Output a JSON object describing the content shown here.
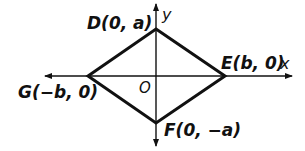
{
  "diagram": {
    "type": "rhombus-on-coordinate-plane",
    "colors": {
      "stroke": "#111111",
      "background": "#ffffff"
    },
    "axes": {
      "x_label": "x",
      "y_label": "y",
      "origin_label": "O"
    },
    "vertices": [
      {
        "name": "D",
        "label": "D(0, a)"
      },
      {
        "name": "E",
        "label": "E(b, 0)"
      },
      {
        "name": "F",
        "label": "F(0, −a)"
      },
      {
        "name": "G",
        "label": "G(−b, 0)"
      }
    ]
  }
}
